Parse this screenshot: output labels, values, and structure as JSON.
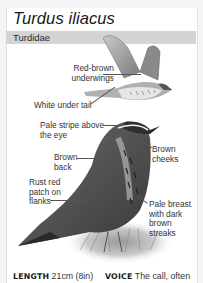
{
  "species": {
    "scientific_name": "Turdus iliacus",
    "family": "Turdidae"
  },
  "annotations": {
    "flight": [
      {
        "lines": [
          "Red-brown",
          "underwings"
        ]
      },
      {
        "lines": [
          "White under tail"
        ]
      }
    ],
    "perched": [
      {
        "lines": [
          "Pale stripe above",
          "the eye"
        ]
      },
      {
        "lines": [
          "Brown",
          "cheeks"
        ]
      },
      {
        "lines": [
          "Brown",
          "back"
        ]
      },
      {
        "lines": [
          "Rust red",
          "patch on",
          "flanks"
        ]
      },
      {
        "lines": [
          "Pale breast",
          "with dark",
          "brown",
          "streaks"
        ]
      }
    ]
  },
  "footer": {
    "length_label": "LENGTH",
    "length_value": "21cm (8in)",
    "voice_label": "VOICE",
    "voice_value": "The call, often"
  },
  "colors": {
    "family_bar": "#d4d4d4",
    "page_bg": "#ffffff",
    "text": "#333333"
  }
}
